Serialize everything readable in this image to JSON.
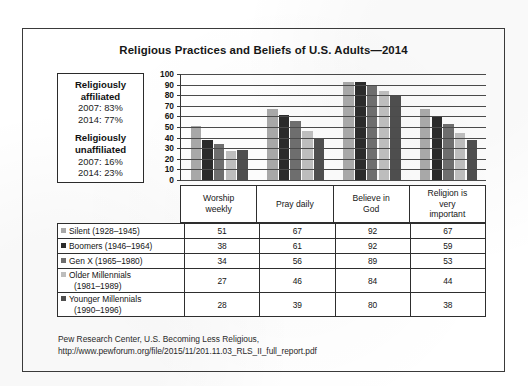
{
  "title": "Religious Practices and Beliefs of U.S. Adults—2014",
  "infobox": {
    "affiliated_heading_line1": "Religiously",
    "affiliated_heading_line2": "affiliated",
    "affiliated_2007": "2007: 83%",
    "affiliated_2014": "2014: 77%",
    "unaffiliated_heading_line1": "Religiously",
    "unaffiliated_heading_line2": "unaffiliated",
    "unaffiliated_2007": "2007: 16%",
    "unaffiliated_2014": "2014: 23%"
  },
  "footer": {
    "line1": "Pew Research Center, U.S. Becoming Less Religious,",
    "line2": "http://www.pewforum.org/file/2015/11/201.11.03_RLS_II_full_report.pdf"
  },
  "chart_data": {
    "type": "bar",
    "title": "Religious Practices and Beliefs of U.S. Adults—2014",
    "xlabel": "",
    "ylabel": "",
    "ylim": [
      0,
      100
    ],
    "yticks": [
      100,
      90,
      80,
      70,
      60,
      50,
      40,
      30,
      20,
      10,
      0
    ],
    "grid": true,
    "legend_position": "table-below",
    "categories": [
      "Worship weekly",
      "Pray daily",
      "Believe in God",
      "Religion is very important"
    ],
    "category_lines": [
      [
        "Worship",
        "weekly"
      ],
      [
        "Pray daily"
      ],
      [
        "Believe in",
        "God"
      ],
      [
        "Religion is",
        "very",
        "important"
      ]
    ],
    "series": [
      {
        "name": "Silent (1928–1945)",
        "label_main": "Silent (1928–1945)",
        "label_sub": "",
        "color": "#a8a8a8",
        "values": [
          51,
          67,
          92,
          67
        ]
      },
      {
        "name": "Boomers (1946–1964)",
        "label_main": "Boomers (1946–1964)",
        "label_sub": "",
        "color": "#2b2b2b",
        "values": [
          38,
          61,
          92,
          59
        ]
      },
      {
        "name": "Gen X (1965–1980)",
        "label_main": "Gen X (1965–1980)",
        "label_sub": "",
        "color": "#6e6e6e",
        "values": [
          34,
          56,
          89,
          53
        ]
      },
      {
        "name": "Older Millennials (1981–1989)",
        "label_main": "Older Millennials",
        "label_sub": "(1981–1989)",
        "color": "#bdbdbd",
        "values": [
          27,
          46,
          84,
          44
        ]
      },
      {
        "name": "Younger Millennials (1990–1996)",
        "label_main": "Younger Millennials",
        "label_sub": "(1990–1996)",
        "color": "#4e4e4e",
        "values": [
          28,
          39,
          80,
          38
        ]
      }
    ]
  }
}
